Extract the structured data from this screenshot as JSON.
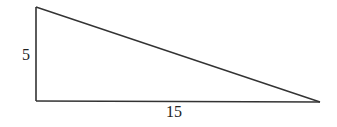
{
  "diagram": {
    "type": "right-triangle",
    "stroke_color": "#333333",
    "vertices": {
      "top_left": [
        36,
        7
      ],
      "bottom_left": [
        36,
        101
      ],
      "bottom_right": [
        320,
        102
      ]
    },
    "labels": {
      "height": "5",
      "base": "15"
    }
  }
}
